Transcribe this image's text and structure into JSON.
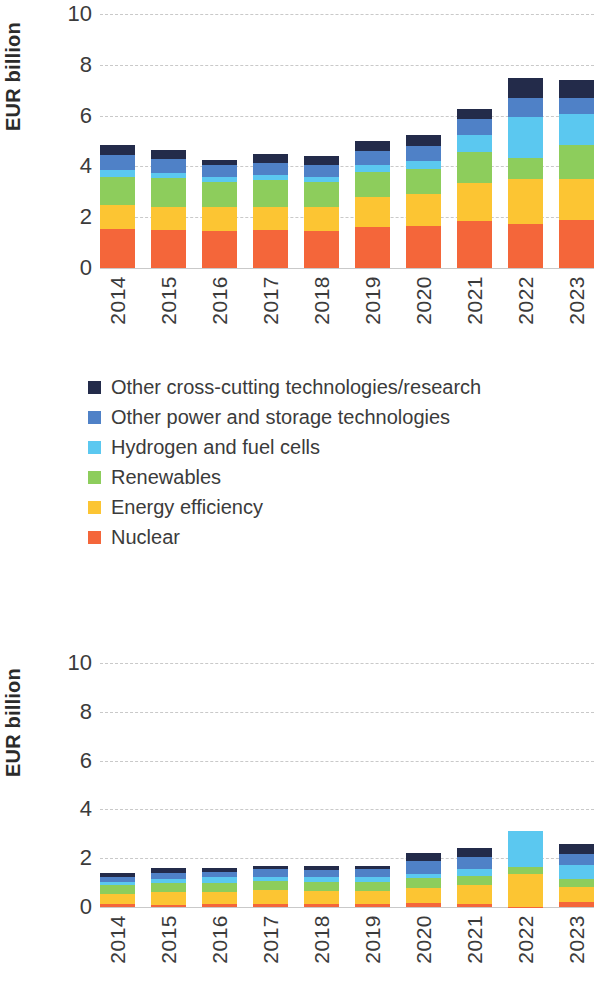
{
  "axis": {
    "y_title": "EUR billion",
    "y_ticks": [
      10,
      8,
      6,
      4,
      2,
      0
    ],
    "x_categories": [
      "2014",
      "2015",
      "2016",
      "2017",
      "2018",
      "2019",
      "2020",
      "2021",
      "2022",
      "2023"
    ]
  },
  "legend": {
    "items": [
      {
        "label": "Other cross-cutting technologies/research",
        "color": "#232b4a",
        "key": "other_cross_cutting"
      },
      {
        "label": "Other power and storage technologies",
        "color": "#4f81c7",
        "key": "other_power_storage"
      },
      {
        "label": "Hydrogen and fuel cells",
        "color": "#5bc8f0",
        "key": "hydrogen_fuel_cells"
      },
      {
        "label": "Renewables",
        "color": "#8dcd5c",
        "key": "renewables"
      },
      {
        "label": "Energy efficiency",
        "color": "#fcc533",
        "key": "energy_efficiency"
      },
      {
        "label": "Nuclear",
        "color": "#f4663a",
        "key": "nuclear"
      }
    ]
  },
  "chart_data": [
    {
      "type": "bar",
      "id": "chart-top",
      "stacked": true,
      "title": "",
      "xlabel": "",
      "ylabel": "EUR billion",
      "ylim": [
        0,
        10
      ],
      "y_ticks": [
        0,
        2,
        4,
        6,
        8,
        10
      ],
      "grid": true,
      "legend_position": "below",
      "categories": [
        "2014",
        "2015",
        "2016",
        "2017",
        "2018",
        "2019",
        "2020",
        "2021",
        "2022",
        "2023"
      ],
      "series": [
        {
          "name": "Nuclear",
          "color": "#f4663a",
          "values": [
            1.55,
            1.5,
            1.45,
            1.5,
            1.45,
            1.6,
            1.65,
            1.85,
            1.75,
            1.9
          ]
        },
        {
          "name": "Energy efficiency",
          "color": "#fcc533",
          "values": [
            0.95,
            0.9,
            0.95,
            0.9,
            0.95,
            1.2,
            1.25,
            1.5,
            1.75,
            1.6
          ]
        },
        {
          "name": "Renewables",
          "color": "#8dcd5c",
          "values": [
            1.1,
            1.15,
            1.0,
            1.05,
            1.0,
            1.0,
            1.0,
            1.2,
            0.85,
            1.35
          ]
        },
        {
          "name": "Hydrogen and fuel cells",
          "color": "#5bc8f0",
          "values": [
            0.25,
            0.2,
            0.2,
            0.2,
            0.2,
            0.25,
            0.3,
            0.7,
            1.6,
            1.2
          ]
        },
        {
          "name": "Other power and storage technologies",
          "color": "#4f81c7",
          "values": [
            0.6,
            0.55,
            0.45,
            0.5,
            0.45,
            0.55,
            0.6,
            0.6,
            0.75,
            0.65
          ]
        },
        {
          "name": "Other cross-cutting technologies/research",
          "color": "#232b4a",
          "values": [
            0.4,
            0.35,
            0.2,
            0.35,
            0.35,
            0.4,
            0.45,
            0.4,
            0.8,
            0.7
          ]
        }
      ],
      "totals": [
        4.7,
        4.6,
        4.25,
        4.45,
        4.4,
        4.95,
        5.2,
        6.2,
        7.45,
        7.95
      ]
    },
    {
      "type": "bar",
      "id": "chart-bottom",
      "stacked": true,
      "title": "",
      "xlabel": "",
      "ylabel": "EUR billion",
      "ylim": [
        0,
        10
      ],
      "y_ticks": [
        0,
        2,
        4,
        6,
        8,
        10
      ],
      "grid": true,
      "legend_position": "none",
      "categories": [
        "2014",
        "2015",
        "2016",
        "2017",
        "2018",
        "2019",
        "2020",
        "2021",
        "2022",
        "2023"
      ],
      "series": [
        {
          "name": "Nuclear",
          "color": "#f4663a",
          "values": [
            0.12,
            0.1,
            0.12,
            0.14,
            0.12,
            0.14,
            0.16,
            0.14,
            0.02,
            0.22
          ]
        },
        {
          "name": "Energy efficiency",
          "color": "#fcc533",
          "values": [
            0.42,
            0.5,
            0.48,
            0.55,
            0.52,
            0.5,
            0.62,
            0.78,
            1.35,
            0.62
          ]
        },
        {
          "name": "Renewables",
          "color": "#8dcd5c",
          "values": [
            0.35,
            0.38,
            0.38,
            0.36,
            0.38,
            0.38,
            0.4,
            0.34,
            0.25,
            0.32
          ]
        },
        {
          "name": "Hydrogen and fuel cells",
          "color": "#5bc8f0",
          "values": [
            0.15,
            0.18,
            0.25,
            0.2,
            0.2,
            0.2,
            0.18,
            0.28,
            1.48,
            0.58
          ]
        },
        {
          "name": "Other power and storage technologies",
          "color": "#4f81c7",
          "values": [
            0.2,
            0.24,
            0.2,
            0.3,
            0.3,
            0.32,
            0.52,
            0.52,
            0.0,
            0.42
          ]
        },
        {
          "name": "Other cross-cutting technologies/research",
          "color": "#232b4a",
          "values": [
            0.16,
            0.2,
            0.17,
            0.15,
            0.18,
            0.16,
            0.32,
            0.34,
            0.0,
            0.44
          ]
        }
      ],
      "totals": [
        1.4,
        1.6,
        1.6,
        1.7,
        1.7,
        1.7,
        2.2,
        2.4,
        3.1,
        2.6
      ]
    }
  ]
}
